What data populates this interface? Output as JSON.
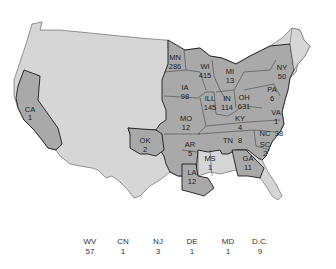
{
  "colors": {
    "background": "#ffffff",
    "land_light": "#d6d6d6",
    "state_highlight": "#a9a9a9",
    "border_dark": "#1a1a1a",
    "text": "#222222"
  },
  "map": {
    "states": [
      {
        "abbr": "CA",
        "value": "1"
      },
      {
        "abbr": "MN",
        "value": "286"
      },
      {
        "abbr": "WI",
        "value": "415"
      },
      {
        "abbr": "MI",
        "value": "13"
      },
      {
        "abbr": "IA",
        "value": "98"
      },
      {
        "abbr": "ILL",
        "value": "145"
      },
      {
        "abbr": "IN",
        "value": "114"
      },
      {
        "abbr": "OH",
        "value": "631"
      },
      {
        "abbr": "NY",
        "value": "50"
      },
      {
        "abbr": "PA",
        "value": "6"
      },
      {
        "abbr": "MO",
        "value": "12"
      },
      {
        "abbr": "KY",
        "value": "4"
      },
      {
        "abbr": "VA",
        "value": "1"
      },
      {
        "abbr": "OK",
        "value": "2"
      },
      {
        "abbr": "AR",
        "value": "5"
      },
      {
        "abbr": "TN",
        "value": "8"
      },
      {
        "abbr": "NC",
        "value": "38"
      },
      {
        "abbr": "SC",
        "value": "2"
      },
      {
        "abbr": "MS",
        "value": "1"
      },
      {
        "abbr": "GA",
        "value": "11"
      },
      {
        "abbr": "LA",
        "value": "12"
      }
    ]
  },
  "footer": {
    "items": [
      {
        "abbr": "WV",
        "value": "57"
      },
      {
        "abbr": "CN",
        "value": "1"
      },
      {
        "abbr": "NJ",
        "value": "3"
      },
      {
        "abbr": "DE",
        "value": "1"
      },
      {
        "abbr": "MD",
        "value": "1"
      },
      {
        "abbr": "D.C.",
        "value": "9"
      }
    ]
  }
}
